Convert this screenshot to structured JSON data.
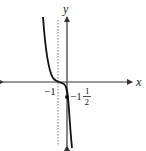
{
  "diagram": {
    "type": "function-graph",
    "axes": {
      "x_label": "x",
      "y_label": "y"
    },
    "asymptote": {
      "style": "dashed vertical",
      "x_value": "-1"
    },
    "labels": {
      "x_intercept_label": "−1",
      "y_intercept_whole": "−1",
      "y_intercept_frac_num": "1",
      "y_intercept_frac_den": "2"
    },
    "points": [
      {
        "name": "y-intercept",
        "value": "-1 1/2"
      }
    ],
    "colors": {
      "curve": "#111111",
      "axes": "#333333",
      "asymptote": "#777777"
    }
  }
}
